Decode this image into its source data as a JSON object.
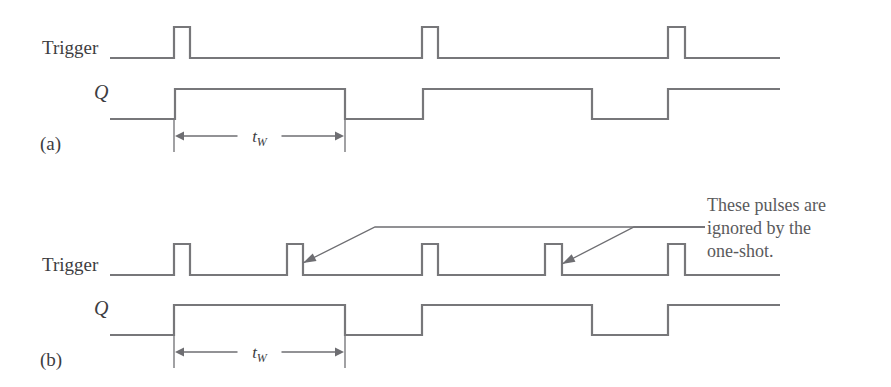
{
  "figure": {
    "background_color": "#ffffff",
    "line_color": "#77777a",
    "text_color": "#3d3d3f",
    "note_text_color": "#5a5a5c"
  },
  "labels": {
    "trigger_a": "Trigger",
    "q_a": "Q",
    "part_a": "(a)",
    "trigger_b": "Trigger",
    "q_b": "Q",
    "part_b": "(b)",
    "tw_a_base": "t",
    "tw_a_sub": "W",
    "tw_b_base": "t",
    "tw_b_sub": "W"
  },
  "annotation": {
    "lines": [
      "These pulses are",
      "ignored by the",
      "one-shot."
    ],
    "line1": "These pulses are",
    "line2": "ignored by the",
    "line3": "one-shot."
  },
  "chart_data": {
    "type": "line",
    "xlabel": "",
    "ylabel": "",
    "x_range": [
      110,
      780
    ],
    "grid": false,
    "legend_position": "none",
    "panels": [
      {
        "id": "a",
        "label": "(a)",
        "signals": [
          {
            "name": "Trigger",
            "low_y": 58,
            "high_y": 27,
            "start_x": 110,
            "end_x": 780,
            "pulses": [
              {
                "start_x": 174,
                "end_x": 190
              },
              {
                "start_x": 422,
                "end_x": 438
              },
              {
                "start_x": 668,
                "end_x": 685
              }
            ]
          },
          {
            "name": "Q",
            "low_y": 119,
            "high_y": 89,
            "start_x": 110,
            "end_x": 780,
            "pulses": [
              {
                "start_x": 175,
                "end_x": 345
              },
              {
                "start_x": 423,
                "end_x": 592
              },
              {
                "start_x": 668,
                "end_x": 780
              }
            ]
          }
        ],
        "dimension": {
          "label": "tW",
          "start_x": 174,
          "end_x": 345,
          "y": 136,
          "tick_top": 120,
          "tick_bottom": 152
        }
      },
      {
        "id": "b",
        "label": "(b)",
        "signals": [
          {
            "name": "Trigger",
            "low_y": 275,
            "high_y": 244,
            "start_x": 110,
            "end_x": 780,
            "pulses": [
              {
                "start_x": 174,
                "end_x": 190
              },
              {
                "start_x": 287,
                "end_x": 303
              },
              {
                "start_x": 422,
                "end_x": 438
              },
              {
                "start_x": 545,
                "end_x": 562
              },
              {
                "start_x": 668,
                "end_x": 685
              }
            ]
          },
          {
            "name": "Q",
            "low_y": 335,
            "high_y": 305,
            "start_x": 110,
            "end_x": 780,
            "pulses": [
              {
                "start_x": 174,
                "end_x": 345
              },
              {
                "start_x": 422,
                "end_x": 592
              },
              {
                "start_x": 668,
                "end_x": 780
              }
            ]
          }
        ],
        "dimension": {
          "label": "tW",
          "start_x": 174,
          "end_x": 345,
          "y": 352,
          "tick_top": 336,
          "tick_bottom": 368
        },
        "callouts": [
          {
            "target_x": 303,
            "target_y": 263,
            "elbow_x": 375,
            "elbow_y": 227
          },
          {
            "target_x": 562,
            "target_y": 264,
            "elbow_x": 634,
            "elbow_y": 227
          }
        ],
        "callout_text_anchor_x": 705,
        "callout_text_anchor_y": 227
      }
    ]
  }
}
